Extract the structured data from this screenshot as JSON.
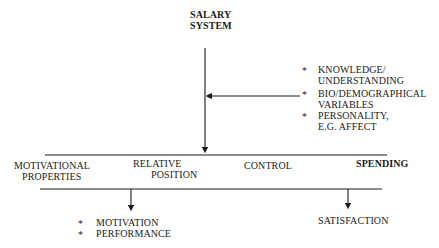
{
  "diagram": {
    "top_node": {
      "line1": "SALARY",
      "line2": "SYSTEM"
    },
    "influences": [
      {
        "bullet": "*",
        "line1": "KNOWLEDGE/",
        "line2": "UNDERSTANDING"
      },
      {
        "bullet": "*",
        "line1": "BIO/DEMOGRAPHICAL",
        "line2": "VARIABLES"
      },
      {
        "bullet": "*",
        "line1": "PERSONALITY,",
        "line2": "E.G. AFFECT"
      }
    ],
    "motivational_properties": {
      "heading": {
        "line1": "MOTIVATIONAL",
        "line2": "PROPERTIES"
      },
      "items": [
        {
          "line1": "RELATIVE",
          "line2": "POSITION"
        },
        {
          "line1": "CONTROL"
        },
        {
          "line1": "SPENDING"
        }
      ]
    },
    "outcomes_left": [
      {
        "bullet": "*",
        "label": "MOTIVATION"
      },
      {
        "bullet": "*",
        "label": "PERFORMANCE"
      }
    ],
    "outcome_right": {
      "label": "SATISFACTION"
    },
    "line_color": "#1a1a1a"
  }
}
